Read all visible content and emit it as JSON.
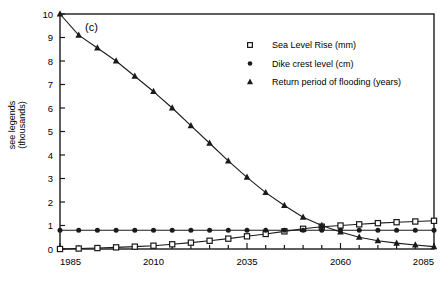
{
  "panel": {
    "label": "(c)"
  },
  "axes": {
    "y_title_line1": "see legends",
    "y_title_line2": "(thousands)",
    "y_ticks": [
      "0",
      "1",
      "2",
      "3",
      "4",
      "5",
      "6",
      "7",
      "8",
      "9",
      "10"
    ],
    "x_ticks": [
      "1985",
      "2010",
      "2035",
      "2060",
      "2085"
    ]
  },
  "legend": {
    "items": [
      {
        "marker": "open-square",
        "label": "Sea Level Rise (mm)"
      },
      {
        "marker": "filled-circle",
        "label": "Dike crest level (cm)"
      },
      {
        "marker": "filled-triangle",
        "label": "Return period of flooding (years)"
      }
    ]
  },
  "chart_data": {
    "type": "line",
    "title": "(c)",
    "xlabel": "",
    "ylabel": "see legends (thousands)",
    "xlim": [
      1985,
      2085
    ],
    "ylim": [
      0,
      10
    ],
    "xticks": [
      1985,
      2010,
      2035,
      2060,
      2085
    ],
    "yticks": [
      0,
      1,
      2,
      3,
      4,
      5,
      6,
      7,
      8,
      9,
      10
    ],
    "minor_xtick_interval": 5,
    "grid": false,
    "legend_position": "upper-center-right",
    "x": [
      1985,
      1990,
      1995,
      2000,
      2005,
      2010,
      2015,
      2020,
      2025,
      2030,
      2035,
      2040,
      2045,
      2050,
      2055,
      2060,
      2065,
      2070,
      2075,
      2080,
      2085
    ],
    "series": [
      {
        "name": "Sea Level Rise (mm)",
        "marker": "open-square",
        "values": [
          0.0,
          0.02,
          0.04,
          0.07,
          0.1,
          0.14,
          0.2,
          0.27,
          0.35,
          0.44,
          0.54,
          0.64,
          0.75,
          0.86,
          0.95,
          1.0,
          1.05,
          1.1,
          1.14,
          1.17,
          1.2
        ]
      },
      {
        "name": "Dike crest level (cm)",
        "marker": "filled-circle",
        "values": [
          0.8,
          0.8,
          0.8,
          0.8,
          0.8,
          0.8,
          0.8,
          0.8,
          0.8,
          0.8,
          0.8,
          0.8,
          0.8,
          0.8,
          0.8,
          0.8,
          0.8,
          0.8,
          0.8,
          0.8,
          0.8
        ]
      },
      {
        "name": "Return period of flooding (years)",
        "marker": "filled-triangle",
        "values": [
          10.0,
          9.1,
          8.55,
          8.0,
          7.35,
          6.7,
          6.0,
          5.25,
          4.5,
          3.75,
          3.05,
          2.4,
          1.85,
          1.35,
          1.0,
          0.72,
          0.5,
          0.35,
          0.25,
          0.17,
          0.1
        ]
      }
    ]
  }
}
